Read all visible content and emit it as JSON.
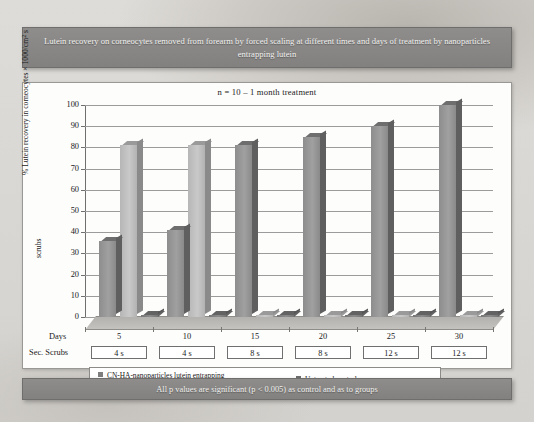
{
  "title_banner": "Lutein recovery on corneocytes removed from forearm by forced scaling at different times and days of treatment by nanoparticles entrapping lutein",
  "footer_banner": "All p values are significant (p < 0.005) as control and as to groups",
  "colors": {
    "banner_bg": "#8a8987",
    "banner_text": "#f2f1ef",
    "panel_bg": "#fdfdfc",
    "series1": "#8d8d8d",
    "series2": "#bdbdbd",
    "series3": "#777777",
    "gridline": "#9b9b9b",
    "page_bg": "#d8d6d2"
  },
  "axis_rows": {
    "days_label": "Days",
    "scrubs_label": "Sec. Scrubs",
    "days": [
      "5",
      "10",
      "15",
      "20",
      "25",
      "30"
    ],
    "scrubs": [
      "4 s",
      "4 s",
      "8 s",
      "8 s",
      "12 s",
      "12 s"
    ]
  },
  "chart_data": {
    "type": "bar",
    "title": "Lutein recovery on corneocytes removed from forearm by forced scaling at different times and days of treatment by nanoparticles entrapping lutein",
    "subtitle": "n = 10 – 1 month treatment",
    "xlabel": "Days",
    "ylabel": "% Lutein recovery in corneocytes × 1000/cm² s scrubs",
    "ylabel_parts": {
      "prefix": "% Lutein recovery in corneocytes × 1000/cm",
      "superscript": "2",
      "suffix": " s",
      "second_line": "scrubs"
    },
    "categories": [
      "5",
      "10",
      "15",
      "20",
      "25",
      "30"
    ],
    "secondary_categories": [
      "4 s",
      "4 s",
      "8 s",
      "8 s",
      "12 s",
      "12 s"
    ],
    "series": [
      {
        "name": "CN-HA-nanoparticles lutein entrapping",
        "values": [
          36,
          41,
          81,
          85,
          90,
          100
        ]
      },
      {
        "name": "HA-CN-nanoparticles lutein entrapping",
        "values": [
          81,
          81,
          0,
          0,
          0,
          0
        ]
      },
      {
        "name": "Untreated control",
        "values": [
          0,
          0,
          0,
          0,
          0,
          0
        ]
      }
    ],
    "ylim": [
      0,
      100
    ],
    "yticks": [
      0,
      10,
      20,
      30,
      40,
      50,
      60,
      70,
      80,
      90,
      100
    ],
    "grid": true,
    "legend_position": "bottom"
  },
  "legend": [
    {
      "label": "CN-HA-nanoparticles lutein entrapping"
    },
    {
      "label": "HA-CN-nanoparticles lutein entrapping"
    },
    {
      "label": "Untreated control"
    }
  ]
}
